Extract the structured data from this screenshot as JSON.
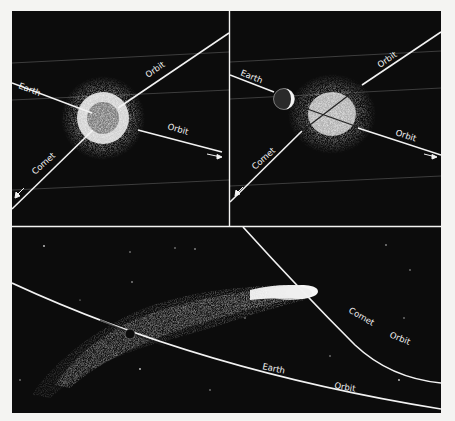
{
  "figure": {
    "background": "#f4f4f2",
    "panel_color": "#0c0c0c",
    "line_color": "#f2f2f2",
    "panels": {
      "top_left": {
        "description": "Earth passing through comet head",
        "labels": {
          "earth": "Earth",
          "earth_orbit": "Orbit",
          "comet": "Comet",
          "comet_orbit": "Orbit"
        }
      },
      "top_right": {
        "description": "Earth beside comet head",
        "labels": {
          "earth": "Earth",
          "earth_orbit": "Orbit",
          "comet": "Comet",
          "comet_orbit": "Orbit"
        }
      },
      "bottom": {
        "description": "Earth passing through comet tail",
        "labels": {
          "comet": "Comet",
          "comet_orbit": "Orbit",
          "earth": "Earth",
          "earth_orbit": "Orbit"
        }
      }
    }
  }
}
